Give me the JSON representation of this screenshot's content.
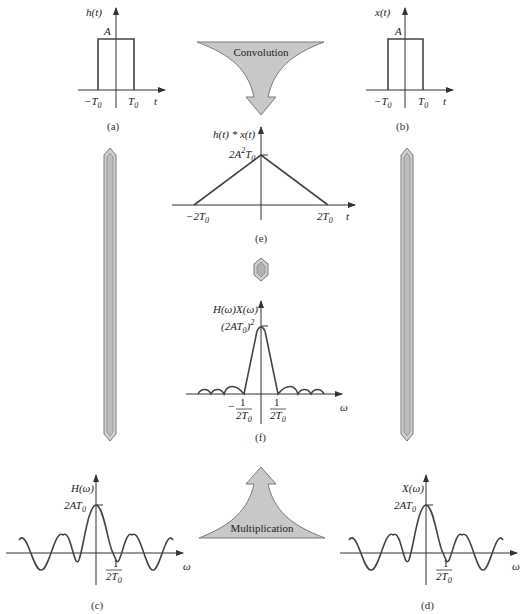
{
  "panels": {
    "a": {
      "caption": "(a)",
      "y_label": "h(t)",
      "x_label": "t",
      "amplitude_label": "A",
      "x_ticks": [
        "−T0",
        "T0"
      ],
      "shape": "rectangular pulse from −T0 to T0 with height A"
    },
    "b": {
      "caption": "(b)",
      "y_label": "x(t)",
      "x_label": "t",
      "amplitude_label": "A",
      "x_ticks": [
        "−T0",
        "T0"
      ],
      "shape": "rectangular pulse from −T0 to T0 with height A"
    },
    "c": {
      "caption": "(c)",
      "y_label": "H(ω)",
      "x_label": "ω",
      "peak_label": "2AT0",
      "x_tick": "1/(2T0)",
      "shape": "sinc function"
    },
    "d": {
      "caption": "(d)",
      "y_label": "X(ω)",
      "x_label": "ω",
      "peak_label": "2AT0",
      "x_tick": "1/(2T0)",
      "shape": "sinc function"
    },
    "e": {
      "caption": "(e)",
      "y_label": "h(t) * x(t)",
      "x_label": "t",
      "peak_label": "2A²T0",
      "x_ticks": [
        "−2T0",
        "2T0"
      ],
      "shape": "triangle from −2T0 to 2T0 with peak 2A²T0"
    },
    "f": {
      "caption": "(f)",
      "y_label": "H(ω)X(ω)",
      "x_label": "ω",
      "peak_label": "(2AT0)²",
      "x_ticks": [
        "−1/(2T0)",
        "1/(2T0)"
      ],
      "shape": "sinc squared"
    }
  },
  "arrows": {
    "convolution": "Convolution",
    "multiplication": "Multiplication"
  },
  "labels": {
    "h_t": "h(t)",
    "x_t": "x(t)",
    "t": "t",
    "A": "A",
    "neg_T0": "−T",
    "T0": "T",
    "sub0": "0",
    "conv_y": "h(t) * x(t)",
    "two_A2T0_a": "2A",
    "two_A2T0_sup": "2",
    "two_A2T0_b": "T",
    "neg_2T0": "−2T",
    "pos_2T0": "2T",
    "Hw": "H(ω)",
    "Xw": "X(ω)",
    "HXw": "H(ω)X(ω)",
    "omega": "ω",
    "two_AT0": "2AT",
    "sq_open": "(2AT",
    "sq_close": ")",
    "sq_sup": "2",
    "one": "1",
    "two_T": "2T",
    "minus": "−"
  }
}
